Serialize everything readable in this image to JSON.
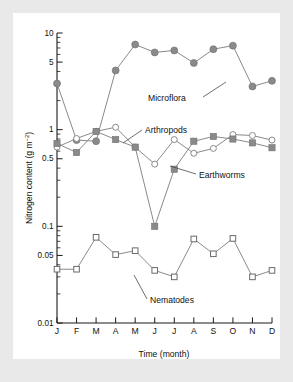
{
  "figure": {
    "background": "#e9e9e9",
    "panel_background": "#ffffff"
  },
  "axes": {
    "ylabel": "Nitrogen content (g m",
    "ylabel_sup": "−2",
    "ylabel_close": ")",
    "xlabel": "Time (month)",
    "y_ticks": [
      "10",
      "5",
      "1",
      "0.5",
      "0.1",
      "0.05",
      "0.01"
    ],
    "x_ticks": [
      "J",
      "F",
      "M",
      "A",
      "M",
      "J",
      "J",
      "A",
      "S",
      "O",
      "N",
      "D"
    ]
  },
  "annotations": [
    {
      "name": "microflora",
      "label": "Microflora"
    },
    {
      "name": "arthropods",
      "label": "Arthropods"
    },
    {
      "name": "earthworms",
      "label": "Earthworms"
    },
    {
      "name": "nematodes",
      "label": "Nematodes"
    }
  ],
  "chart_data": {
    "type": "line",
    "title": "",
    "xlabel": "Time (month)",
    "ylabel": "Nitrogen content (g m-2)",
    "yscale": "log",
    "ylim": [
      0.01,
      10
    ],
    "ytick_values": [
      10,
      5,
      1,
      0.5,
      0.1,
      0.05,
      0.01
    ],
    "grid": false,
    "legend": "inline-annotations",
    "categories": [
      "J",
      "F",
      "M",
      "A",
      "M",
      "J",
      "J",
      "A",
      "S",
      "O",
      "N",
      "D"
    ],
    "series": [
      {
        "name": "Microflora",
        "marker": "filled-circle",
        "color": "#8a8a8a",
        "values": [
          3.0,
          0.78,
          0.76,
          4.1,
          7.6,
          6.3,
          6.6,
          4.9,
          6.8,
          7.4,
          2.8,
          3.2
        ]
      },
      {
        "name": "Arthropods",
        "marker": "open-circle",
        "color": "#8a8a8a",
        "values": [
          0.66,
          0.81,
          0.96,
          1.06,
          0.66,
          0.44,
          0.79,
          0.57,
          0.64,
          0.89,
          0.87,
          0.78
        ]
      },
      {
        "name": "Earthworms",
        "marker": "filled-square",
        "color": "#8a8a8a",
        "values": [
          0.72,
          0.58,
          0.96,
          0.79,
          0.66,
          0.1,
          0.39,
          0.76,
          0.85,
          0.8,
          0.73,
          0.65
        ]
      },
      {
        "name": "Nematodes",
        "marker": "open-square",
        "color": "#ffffff",
        "values": [
          0.036,
          0.036,
          0.077,
          0.051,
          0.056,
          0.035,
          0.03,
          0.074,
          0.052,
          0.075,
          0.03,
          0.035
        ]
      }
    ]
  }
}
